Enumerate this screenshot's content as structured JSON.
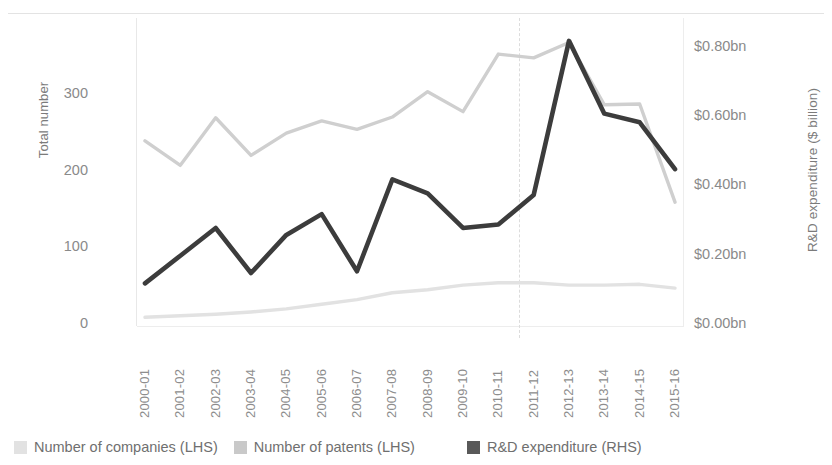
{
  "chart_data": {
    "type": "line",
    "title": "",
    "categories": [
      "2000-01",
      "2001-02",
      "2002-03",
      "2003-04",
      "2004-05",
      "2005-06",
      "2006-07",
      "2007-08",
      "2008-09",
      "2009-10",
      "2010-11",
      "2011-12",
      "2012-13",
      "2013-14",
      "2014-15",
      "2015-16"
    ],
    "series": [
      {
        "name": "Number of companies (LHS)",
        "axis": "left",
        "color": "#e2e2e2",
        "values": [
          10,
          12,
          14,
          17,
          21,
          27,
          33,
          42,
          46,
          52,
          55,
          55,
          52,
          52,
          53,
          48
        ]
      },
      {
        "name": "Number of patents (LHS)",
        "axis": "left",
        "color": "#cfcfcf",
        "values": [
          240,
          208,
          270,
          221,
          250,
          266,
          255,
          271,
          304,
          278,
          353,
          348,
          368,
          287,
          288,
          160
        ]
      },
      {
        "name": "R&D expenditure (RHS)",
        "axis": "right",
        "color": "#3c3c3c",
        "values": [
          0.12,
          0.2,
          0.28,
          0.15,
          0.26,
          0.32,
          0.155,
          0.42,
          0.38,
          0.28,
          0.29,
          0.375,
          0.82,
          0.61,
          0.585,
          0.45
        ]
      }
    ],
    "xlabel": "",
    "ylabel_left": "Total number",
    "ylabel_right": "R&D expenditure ($ billion)",
    "ylim_left": [
      0,
      400
    ],
    "yticks_left": [
      0,
      100,
      200,
      300
    ],
    "yticklabels_left": [
      "0",
      "100",
      "200",
      "300"
    ],
    "ylim_right": [
      0,
      0.886
    ],
    "yticks_right": [
      0.0,
      0.2,
      0.4,
      0.6,
      0.8
    ],
    "yticklabels_right": [
      "$0.00bn",
      "$0.20bn",
      "$0.40bn",
      "$0.60bn",
      "$0.80bn"
    ],
    "grid": false,
    "legend_position": "bottom",
    "annotations": [
      {
        "type": "vertical-dashed-line",
        "at_category": "2010-11",
        "label": ""
      }
    ]
  },
  "axes": {
    "left_title": "Total number",
    "right_title": "R&D expenditure ($ billion)"
  },
  "legend": {
    "items": [
      {
        "label": "Number of companies (LHS)",
        "color": "#e2e2e2"
      },
      {
        "label": "Number of patents (LHS)",
        "color": "#c9c9c9"
      },
      {
        "label": "R&D expenditure (RHS)",
        "color": "#595959"
      }
    ]
  }
}
